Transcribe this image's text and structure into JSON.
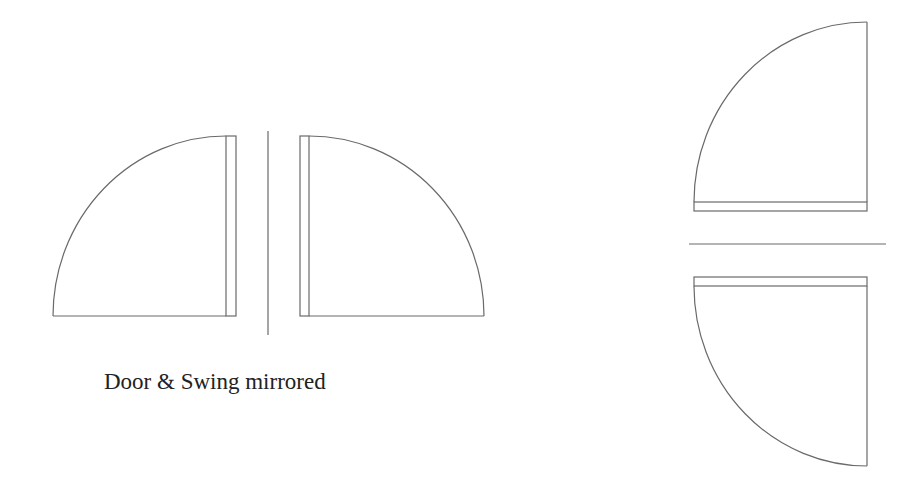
{
  "caption": "Door & Swing mirrored",
  "colors": {
    "background": "#ffffff",
    "line": "#6a6a6a",
    "text": "#222222"
  },
  "diagram": {
    "groups": [
      {
        "name": "horizontal-mirror-pair",
        "divider": {
          "orientation": "vertical",
          "x": 268,
          "y1": 131,
          "y2": 335
        },
        "doors": [
          {
            "name": "left-door",
            "leaf": {
              "x": 226,
              "y": 136,
              "w": 10,
              "h": 180
            },
            "swing": "left"
          },
          {
            "name": "right-door",
            "leaf": {
              "x": 300,
              "y": 136,
              "w": 9,
              "h": 180
            },
            "swing": "right"
          }
        ]
      },
      {
        "name": "vertical-mirror-pair",
        "divider": {
          "orientation": "horizontal",
          "y": 244,
          "x1": 689,
          "x2": 886
        },
        "doors": [
          {
            "name": "top-door",
            "leaf": {
              "x": 694,
              "y": 202,
              "w": 173,
              "h": 9
            },
            "swing": "up"
          },
          {
            "name": "bottom-door",
            "leaf": {
              "x": 694,
              "y": 277,
              "w": 173,
              "h": 9
            },
            "swing": "down"
          }
        ]
      }
    ]
  }
}
